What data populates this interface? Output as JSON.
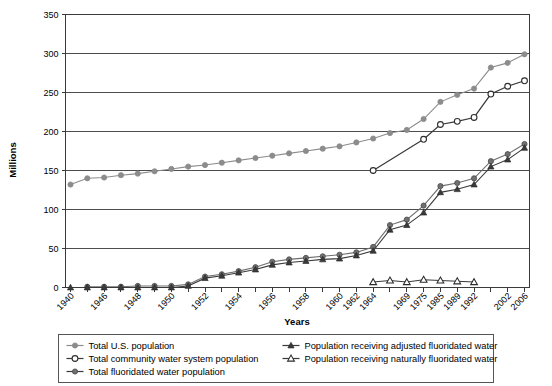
{
  "chart_data": {
    "type": "line",
    "title": "",
    "xlabel": "Years",
    "ylabel": "Millions",
    "ylim": [
      0,
      350
    ],
    "ytick_step": 50,
    "yticks": [
      "0",
      "50",
      "100",
      "150",
      "200",
      "250",
      "300",
      "350"
    ],
    "grid": true,
    "legend_position": "bottom",
    "categories": [
      "1940",
      "1945",
      "1946",
      "1947",
      "1948",
      "1949",
      "1950",
      "1951",
      "1952",
      "1953",
      "1954",
      "1955",
      "1956",
      "1957",
      "1958",
      "1959",
      "1960",
      "1962",
      "1964",
      "1967",
      "1969",
      "1975",
      "1985",
      "1989",
      "1992",
      "2000",
      "2002",
      "2006"
    ],
    "xtick_labels": [
      "1940",
      "1946",
      "1948",
      "1950",
      "1952",
      "1954",
      "1956",
      "1958",
      "1960",
      "1962",
      "1964",
      "1969",
      "1975",
      "1985",
      "1989",
      "1992",
      "2002",
      "2006"
    ],
    "series": [
      {
        "name": "Total U.S. population",
        "marker": "filled-circle",
        "color": "#8c8c8c",
        "x": [
          "1940",
          "1945",
          "1946",
          "1947",
          "1948",
          "1949",
          "1950",
          "1951",
          "1952",
          "1953",
          "1954",
          "1955",
          "1956",
          "1957",
          "1958",
          "1959",
          "1960",
          "1962",
          "1964",
          "1967",
          "1969",
          "1975",
          "1985",
          "1989",
          "1992",
          "2000",
          "2002",
          "2006"
        ],
        "values": [
          132,
          140,
          141,
          144,
          146,
          149,
          152,
          155,
          157,
          160,
          163,
          166,
          169,
          172,
          175,
          178,
          181,
          186,
          191,
          198,
          202,
          216,
          238,
          247,
          255,
          282,
          288,
          299
        ]
      },
      {
        "name": "Total community water system population",
        "marker": "open-circle",
        "color": "#3a3a3a",
        "x": [
          "1964",
          "1975",
          "1985",
          "1989",
          "1992",
          "2000",
          "2002",
          "2006"
        ],
        "values": [
          150,
          190,
          209,
          213,
          218,
          248,
          258,
          265
        ]
      },
      {
        "name": "Total fluoridated water population",
        "marker": "filled-circle-dark",
        "color": "#6e6e6e",
        "x": [
          "1945",
          "1946",
          "1947",
          "1948",
          "1949",
          "1950",
          "1951",
          "1952",
          "1953",
          "1954",
          "1955",
          "1956",
          "1957",
          "1958",
          "1959",
          "1960",
          "1962",
          "1964",
          "1967",
          "1969",
          "1975",
          "1985",
          "1989",
          "1992",
          "2000",
          "2002",
          "2006"
        ],
        "values": [
          1,
          1,
          1,
          2,
          2,
          2,
          4,
          14,
          17,
          21,
          26,
          33,
          36,
          38,
          40,
          42,
          45,
          52,
          80,
          87,
          105,
          130,
          134,
          140,
          162,
          171,
          184
        ]
      },
      {
        "name": "Population receiving adjusted fluoridated water",
        "marker": "filled-triangle",
        "color": "#3a3a3a",
        "x": [
          "1940",
          "1945",
          "1946",
          "1947",
          "1948",
          "1949",
          "1950",
          "1951",
          "1952",
          "1953",
          "1954",
          "1955",
          "1956",
          "1957",
          "1958",
          "1959",
          "1960",
          "1962",
          "1964",
          "1967",
          "1969",
          "1975",
          "1985",
          "1989",
          "1992",
          "2000",
          "2002",
          "2006"
        ],
        "values": [
          0,
          0,
          0,
          0,
          0,
          0,
          0,
          2,
          12,
          15,
          19,
          23,
          29,
          32,
          34,
          36,
          37,
          41,
          47,
          74,
          80,
          96,
          122,
          126,
          132,
          155,
          164,
          179
        ]
      },
      {
        "name": "Population receiving naturally fluoridated water",
        "marker": "open-triangle",
        "color": "#3a3a3a",
        "x": [
          "1964",
          "1967",
          "1969",
          "1975",
          "1985",
          "1989",
          "1992"
        ],
        "values": [
          7,
          9,
          7,
          10,
          9,
          8,
          7
        ]
      }
    ]
  },
  "legend": {
    "items": [
      {
        "label": "Total U.S. population",
        "marker": "filled-circle"
      },
      {
        "label": "Total community water system population",
        "marker": "open-circle"
      },
      {
        "label": "Total fluoridated water population",
        "marker": "filled-circle-dark"
      },
      {
        "label": "Population receiving adjusted fluoridated water",
        "marker": "filled-triangle"
      },
      {
        "label": "Population receiving naturally fluoridated water",
        "marker": "open-triangle"
      }
    ]
  }
}
